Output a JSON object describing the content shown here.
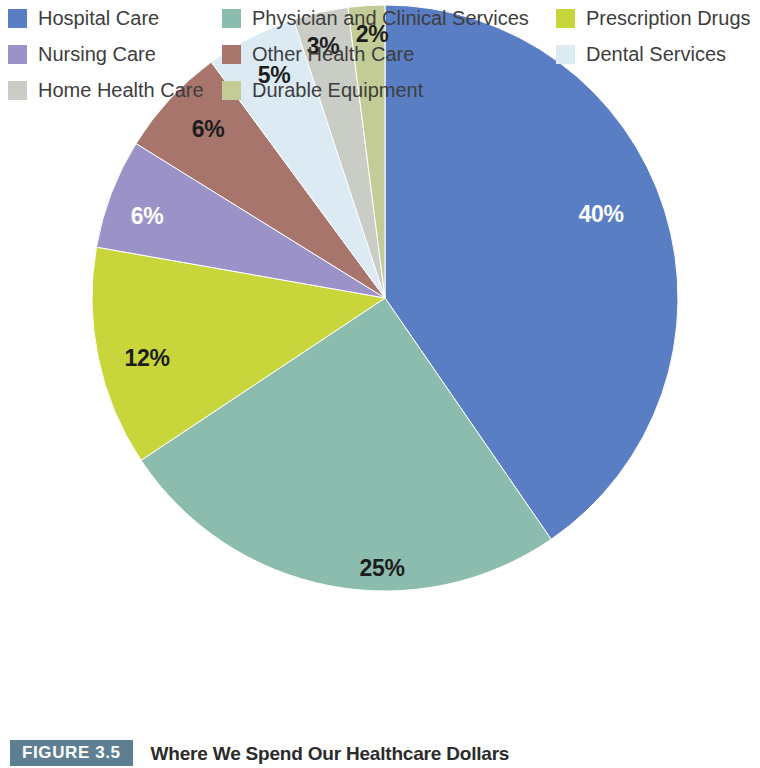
{
  "figure": {
    "tag": "FIGURE 3.5",
    "title": "Where We Spend Our Healthcare Dollars",
    "tag_bg_color": "#5d7f91",
    "tag_text_color": "#ffffff"
  },
  "chart_data": {
    "type": "pie",
    "title": "Where We Spend Our Healthcare Dollars",
    "unit": "percent",
    "total": 99,
    "start_angle_deg": 0,
    "direction": "clockwise",
    "legend_position": "bottom",
    "grid": false,
    "categories": [
      "Hospital Care",
      "Physician and Clinical Services",
      "Prescription Drugs",
      "Nursing Care",
      "Other Health Care",
      "Dental Services",
      "Home Health Care",
      "Durable Equipment"
    ],
    "values": [
      40,
      25,
      12,
      6,
      6,
      5,
      3,
      2
    ],
    "labels": [
      "40%",
      "25%",
      "12%",
      "6%",
      "6%",
      "5%",
      "3%",
      "2%"
    ],
    "colors": [
      "#5a7ec4",
      "#8cbcae",
      "#c8d63c",
      "#9b92c8",
      "#a8756d",
      "#dceaf3",
      "#cacdc5",
      "#c3cc96"
    ],
    "label_text_colors": [
      "#ffffff",
      "#1d1d1d",
      "#1d1d1d",
      "#ffffff",
      "#1d1d1d",
      "#1d1d1d",
      "#1d1d1d",
      "#1d1d1d"
    ],
    "slices": [
      {
        "name": "Hospital Care",
        "value": 40,
        "label": "40%",
        "color": "#5a7ec4",
        "label_color": "#ffffff",
        "label_x": 601,
        "label_y": 216
      },
      {
        "name": "Physician and Clinical Services",
        "value": 25,
        "label": "25%",
        "color": "#8cbcae",
        "label_color": "#1d1d1d",
        "label_x": 382,
        "label_y": 570
      },
      {
        "name": "Prescription Drugs",
        "value": 12,
        "label": "12%",
        "color": "#c8d63c",
        "label_color": "#1d1d1d",
        "label_x": 147,
        "label_y": 360
      },
      {
        "name": "Nursing Care",
        "value": 6,
        "label": "6%",
        "color": "#9b92c8",
        "label_color": "#ffffff",
        "label_x": 147,
        "label_y": 218
      },
      {
        "name": "Other Health Care",
        "value": 6,
        "label": "6%",
        "color": "#a8756d",
        "label_color": "#1d1d1d",
        "label_x": 208,
        "label_y": 131
      },
      {
        "name": "Dental Services",
        "value": 5,
        "label": "5%",
        "color": "#dceaf3",
        "label_color": "#1d1d1d",
        "label_x": 274,
        "label_y": 77
      },
      {
        "name": "Home Health Care",
        "value": 3,
        "label": "3%",
        "color": "#cacdc5",
        "label_color": "#1d1d1d",
        "label_x": 323,
        "label_y": 48
      },
      {
        "name": "Durable Equipment",
        "value": 2,
        "label": "2%",
        "color": "#c3cc96",
        "label_color": "#1d1d1d",
        "label_x": 372,
        "label_y": 36
      }
    ],
    "geometry": {
      "cx": 385,
      "cy": 298,
      "r": 293
    }
  },
  "legend": {
    "columns": [
      {
        "items": [
          {
            "label": "Hospital Care",
            "color": "#5a7ec4"
          },
          {
            "label": "Nursing Care",
            "color": "#9b92c8"
          },
          {
            "label": "Home Health Care",
            "color": "#cacdc5"
          }
        ]
      },
      {
        "items": [
          {
            "label": "Physician and Clinical Services",
            "color": "#8cbcae"
          },
          {
            "label": "Other Health Care",
            "color": "#a8756d"
          },
          {
            "label": "Durable Equipment",
            "color": "#c3cc96"
          }
        ]
      },
      {
        "items": [
          {
            "label": "Prescription Drugs",
            "color": "#c8d63c"
          },
          {
            "label": "Dental Services",
            "color": "#dceaf3"
          }
        ]
      }
    ]
  }
}
